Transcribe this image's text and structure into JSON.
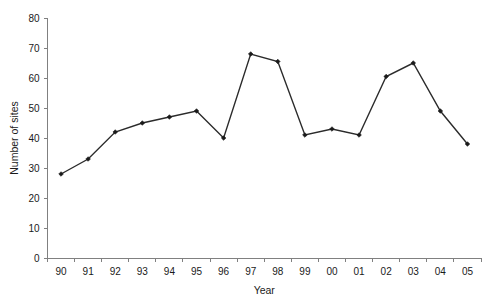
{
  "chart_data": {
    "type": "line",
    "title": "",
    "xlabel": "Year",
    "ylabel": "Number of sites",
    "categories": [
      "90",
      "91",
      "92",
      "93",
      "94",
      "95",
      "96",
      "97",
      "98",
      "99",
      "00",
      "01",
      "02",
      "03",
      "04",
      "05"
    ],
    "values": [
      28,
      33,
      42,
      45,
      47,
      49,
      40,
      68,
      65.5,
      41,
      43,
      41,
      60.5,
      65,
      49,
      38
    ],
    "series": [
      {
        "name": "Number of sites",
        "values": [
          28,
          33,
          42,
          45,
          47,
          49,
          40,
          68,
          65.5,
          41,
          43,
          41,
          60.5,
          65,
          49,
          38
        ]
      }
    ],
    "ylim": [
      0,
      80
    ],
    "yticks": [
      0,
      10,
      20,
      30,
      40,
      50,
      60,
      70,
      80
    ],
    "ytick_labels": [
      "0",
      "10",
      "20",
      "30",
      "40",
      "50",
      "60",
      "70",
      "80"
    ],
    "xtick_labels": [
      "90",
      "91",
      "92",
      "93",
      "94",
      "95",
      "96",
      "97",
      "98",
      "99",
      "00",
      "01",
      "02",
      "03",
      "04",
      "05"
    ],
    "grid": false,
    "legend": false,
    "legend_position": "none",
    "marker": "filled-diamond",
    "line_color": "#2b2b2b",
    "marker_color": "#1a1a1a",
    "axis_color": "#808080"
  }
}
